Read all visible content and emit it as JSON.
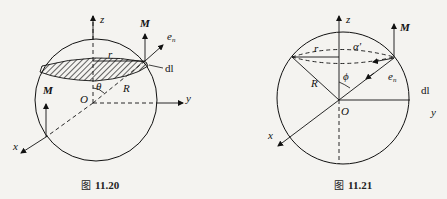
{
  "figures": [
    {
      "id": "fig-11-20",
      "caption_prefix": "图",
      "caption_number": "11.20",
      "labels": {
        "z": "z",
        "y": "y",
        "x": "x",
        "origin": "O",
        "M_top": "M",
        "M_left": "M",
        "en_main": "e",
        "en_sub": "n",
        "dl": "dl",
        "r": "r",
        "R": "R",
        "theta": "θ"
      }
    },
    {
      "id": "fig-11-21",
      "caption_prefix": "图",
      "caption_number": "11.21",
      "labels": {
        "z": "z",
        "y": "y",
        "x": "x",
        "origin": "O",
        "M": "M",
        "en_main": "e",
        "en_sub": "n",
        "dl": "dl",
        "r": "r",
        "R": "R",
        "phi": "ϕ",
        "alpha": "α'"
      }
    }
  ],
  "colors": {
    "background": "#f4f3f0",
    "ink": "#111111"
  }
}
